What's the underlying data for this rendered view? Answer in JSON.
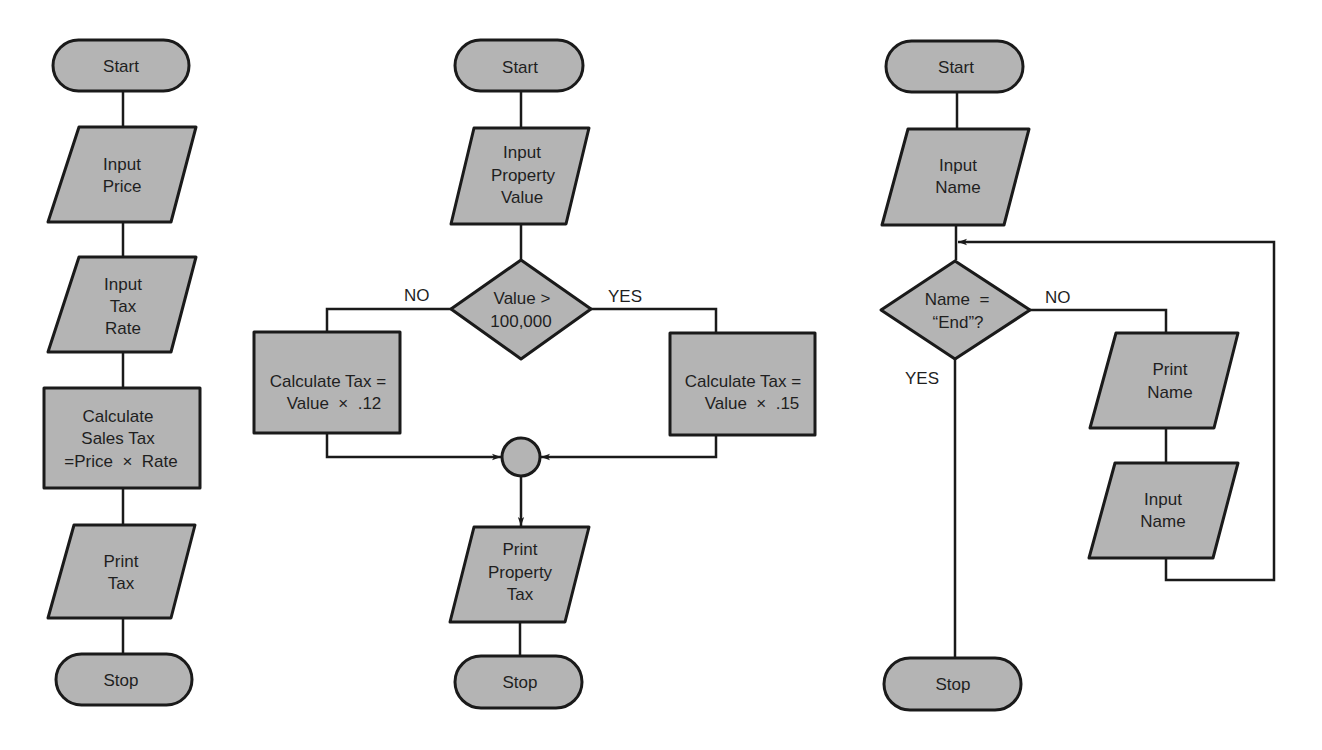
{
  "colors": {
    "shape_fill": "#b4b4b4",
    "stroke": "#1a1a1a",
    "text": "#1f1f1f",
    "background": "#ffffff"
  },
  "flowcharts": [
    {
      "name": "sales-tax",
      "nodes": {
        "start": {
          "type": "terminal",
          "lines": [
            "Start"
          ]
        },
        "input_price": {
          "type": "input-output",
          "lines": [
            "Input",
            "Price"
          ]
        },
        "input_rate": {
          "type": "input-output",
          "lines": [
            "Input",
            "Tax",
            "Rate"
          ]
        },
        "calc": {
          "type": "process",
          "lines": [
            "Calculate",
            "Sales Tax",
            "=Price  ×  Rate"
          ]
        },
        "print": {
          "type": "input-output",
          "lines": [
            "Print",
            "Tax"
          ]
        },
        "stop": {
          "type": "terminal",
          "lines": [
            "Stop"
          ]
        }
      }
    },
    {
      "name": "property-tax",
      "nodes": {
        "start": {
          "type": "terminal",
          "lines": [
            "Start"
          ]
        },
        "input": {
          "type": "input-output",
          "lines": [
            "Input",
            "Property",
            "Value"
          ]
        },
        "decision": {
          "type": "decision",
          "lines": [
            "Value >",
            "100,000"
          ]
        },
        "calc_no": {
          "type": "process",
          "lines": [
            "Calculate Tax =",
            "Value  ×  .12"
          ]
        },
        "calc_yes": {
          "type": "process",
          "lines": [
            "Calculate Tax =",
            "Value  ×  .15"
          ]
        },
        "connector": {
          "type": "connector",
          "lines": []
        },
        "print": {
          "type": "input-output",
          "lines": [
            "Print",
            "Property",
            "Tax"
          ]
        },
        "stop": {
          "type": "terminal",
          "lines": [
            "Stop"
          ]
        }
      },
      "branch_labels": {
        "no": "NO",
        "yes": "YES"
      }
    },
    {
      "name": "name-loop",
      "nodes": {
        "start": {
          "type": "terminal",
          "lines": [
            "Start"
          ]
        },
        "input1": {
          "type": "input-output",
          "lines": [
            "Input",
            "Name"
          ]
        },
        "decision": {
          "type": "decision",
          "lines": [
            "Name  =",
            "“End”?"
          ]
        },
        "print": {
          "type": "input-output",
          "lines": [
            "Print",
            "Name"
          ]
        },
        "input2": {
          "type": "input-output",
          "lines": [
            "Input",
            "Name"
          ]
        },
        "stop": {
          "type": "terminal",
          "lines": [
            "Stop"
          ]
        }
      },
      "branch_labels": {
        "no": "NO",
        "yes": "YES"
      }
    }
  ]
}
